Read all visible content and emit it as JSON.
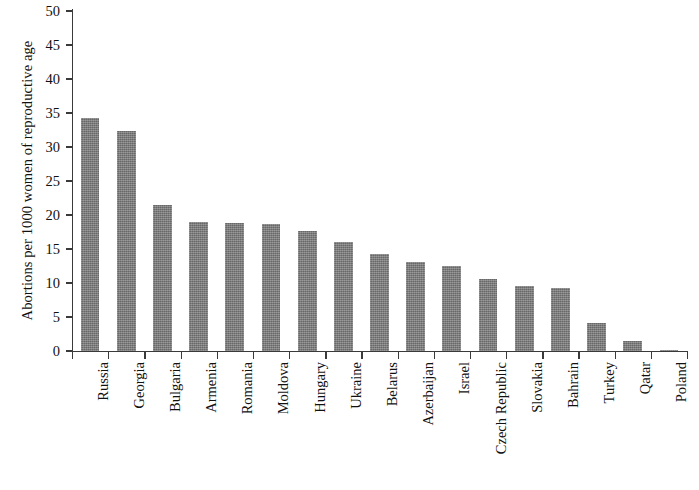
{
  "chart_data": {
    "type": "bar",
    "title": "",
    "subtitle": "",
    "xlabel": "",
    "ylabel": "Abortions per 1000 women of reproductive age",
    "ylim": [
      0,
      50
    ],
    "y_ticks": [
      0,
      5,
      10,
      15,
      20,
      25,
      30,
      35,
      40,
      45,
      50
    ],
    "grid": false,
    "legend": false,
    "legend_position": "none",
    "bar_color": "#7d7d7d",
    "axis_color": "#3a3a3a",
    "background_color": "#ffffff",
    "categories": [
      "Russia",
      "Georgia",
      "Bulgaria",
      "Armenia",
      "Romania",
      "Moldova",
      "Hungary",
      "Ukraine",
      "Belarus",
      "Azerbaijan",
      "Israel",
      "Czech Republic",
      "Slovakia",
      "Bahrain",
      "Turkey",
      "Qatar",
      "Poland"
    ],
    "values": [
      34.3,
      32.4,
      21.5,
      19.0,
      18.8,
      18.7,
      17.6,
      16.0,
      14.3,
      13.1,
      12.5,
      10.6,
      9.5,
      9.2,
      4.1,
      1.4,
      0.1
    ]
  }
}
